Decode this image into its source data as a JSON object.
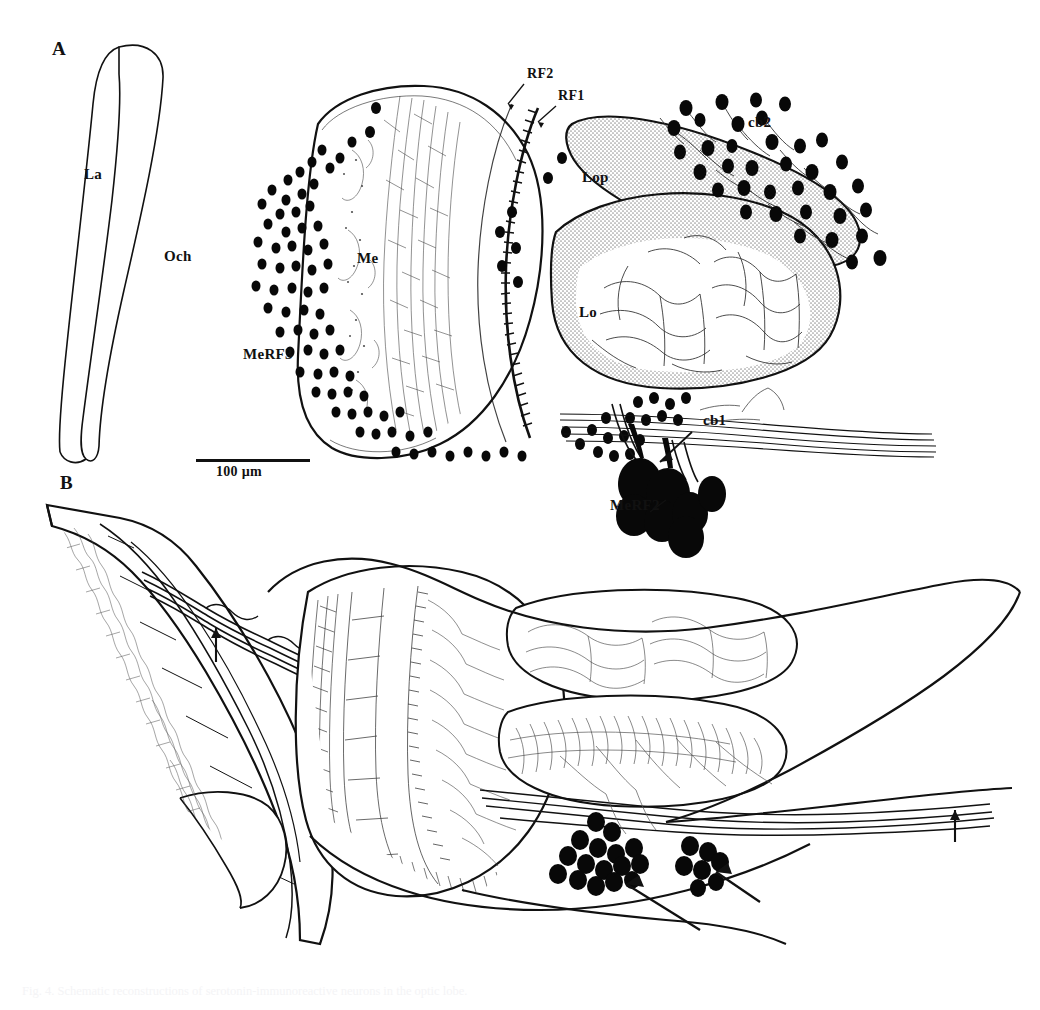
{
  "figure": {
    "type": "scientific-line-drawing",
    "background_color": "#ffffff",
    "ink_color": "#111111",
    "stipple_color": "#b8b8b8",
    "soma_color": "#080808",
    "width": 1040,
    "height": 1010
  },
  "panels": [
    {
      "id": "A",
      "letter": "A",
      "letter_pos": {
        "x": 52,
        "y": 48
      },
      "labels": [
        {
          "name": "la-label",
          "text": "La",
          "x": 84,
          "y": 174,
          "size": "anat"
        },
        {
          "name": "och-label",
          "text": "Och",
          "x": 164,
          "y": 256,
          "size": "anat"
        },
        {
          "name": "me-label",
          "text": "Me",
          "x": 357,
          "y": 258,
          "size": "anat"
        },
        {
          "name": "merf3-label",
          "text": "MeRF3",
          "x": 243,
          "y": 354,
          "size": "anat"
        },
        {
          "name": "rf2-label",
          "text": "RF2",
          "x": 527,
          "y": 74,
          "size": "anat-sm"
        },
        {
          "name": "rf1-label",
          "text": "RF1",
          "x": 558,
          "y": 96,
          "size": "anat-sm"
        },
        {
          "name": "lop-label",
          "text": "Lop",
          "x": 582,
          "y": 177,
          "size": "anat"
        },
        {
          "name": "lo-label",
          "text": "Lo",
          "x": 579,
          "y": 312,
          "size": "anat"
        },
        {
          "name": "cb2-label",
          "text": "cb2",
          "x": 748,
          "y": 122,
          "size": "anat"
        },
        {
          "name": "cb1-label",
          "text": "cb1",
          "x": 703,
          "y": 420,
          "size": "anat"
        },
        {
          "name": "merf2-label",
          "text": "MeRF2",
          "x": 610,
          "y": 505,
          "size": "anat"
        }
      ],
      "scale_bar": {
        "label": "100 µm",
        "x": 196,
        "y": 459,
        "length": 114,
        "label_x": 216,
        "label_y": 466
      }
    },
    {
      "id": "B",
      "letter": "B",
      "letter_pos": {
        "x": 60,
        "y": 482
      },
      "labels": []
    }
  ],
  "caption": {
    "line1": "Fig. 4. Schematic reconstructions of serotonin-immunoreactive neurons in the optic lobe.",
    "line2": ""
  },
  "legend_terms": {
    "La": "lamina",
    "Och": "outer optic chiasma",
    "Me": "medulla",
    "Lo": "lobula",
    "Lop": "lobula plate",
    "RF1": "retinotopic field 1",
    "RF2": "retinotopic field 2",
    "MeRF2": "medulla retinotopic field 2 somata",
    "MeRF3": "medulla retinotopic field 3 somata",
    "cb1": "cell body group 1",
    "cb2": "cell body group 2"
  }
}
